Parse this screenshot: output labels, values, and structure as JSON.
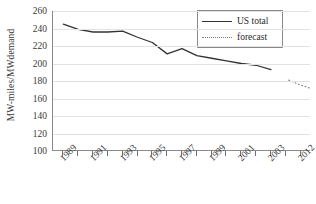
{
  "chart_data": {
    "type": "line",
    "title": "",
    "xlabel": "",
    "ylabel": "MW-miles/MWdemand",
    "ylim": [
      100,
      260
    ],
    "ytick_step": 20,
    "yticks": [
      260,
      240,
      220,
      200,
      180,
      160,
      140,
      120,
      100
    ],
    "grid": true,
    "grid_axis": "y",
    "legend_position": "top-right",
    "x": [
      1989,
      1990,
      1991,
      1992,
      1993,
      1994,
      1995,
      1996,
      1997,
      1998,
      1999,
      2000,
      2001,
      2002,
      2003,
      2012
    ],
    "xtick_labels": [
      "1989",
      "",
      "1991",
      "",
      "1993",
      "",
      "1995",
      "",
      "1997",
      "",
      "1999",
      "",
      "2001",
      "",
      "2003",
      "",
      "2012"
    ],
    "visible_xtick_labels": [
      "1989",
      "1991",
      "1993",
      "1995",
      "1997",
      "1999",
      "2001",
      "2003",
      "2012"
    ],
    "series": [
      {
        "name": "US total",
        "style": "solid",
        "color": "#333333",
        "x": [
          1989,
          1990,
          1991,
          1992,
          1993,
          1994,
          1995,
          1996,
          1997,
          1998,
          1999,
          2000,
          2001,
          2002,
          2003
        ],
        "values": [
          245,
          239,
          236,
          236,
          237,
          230,
          224,
          211,
          217,
          209,
          206,
          203,
          200,
          198,
          193
        ]
      },
      {
        "name": "forecast",
        "style": "dotted",
        "color": "#7d7d7d",
        "x": [
          2011,
          2012,
          2013
        ],
        "values": [
          181,
          176,
          172
        ]
      }
    ],
    "legend": [
      {
        "label": "US total",
        "style": "solid"
      },
      {
        "label": "forecast",
        "style": "dotted"
      }
    ]
  }
}
